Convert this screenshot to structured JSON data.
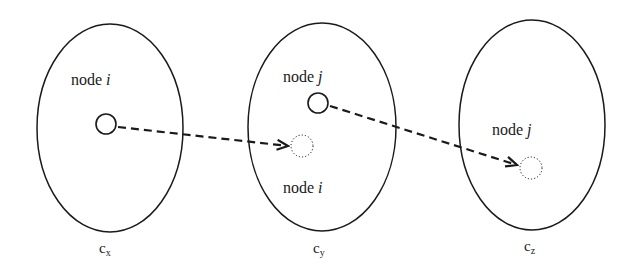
{
  "diagram": {
    "clusters": [
      {
        "id": "cx",
        "name": "c",
        "subscript": "x",
        "cx": 110,
        "cy": 128,
        "rx": 73,
        "ry": 104,
        "labels": [
          {
            "text": "node ",
            "var": "i",
            "x": 71,
            "y": 85
          }
        ]
      },
      {
        "id": "cy",
        "name": "c",
        "subscript": "y",
        "cx": 322,
        "cy": 127,
        "rx": 74,
        "ry": 104,
        "labels": [
          {
            "text": "node ",
            "var": "j",
            "x": 283,
            "y": 82
          },
          {
            "text": "node ",
            "var": "i",
            "x": 283,
            "y": 193
          }
        ]
      },
      {
        "id": "cz",
        "name": "c",
        "subscript": "z",
        "cx": 532,
        "cy": 125,
        "rx": 73,
        "ry": 105,
        "labels": [
          {
            "text": "node ",
            "var": "j",
            "x": 492,
            "y": 135
          }
        ]
      }
    ],
    "nodes": [
      {
        "id": "node-i-in-cx",
        "x": 106,
        "y": 124,
        "r": 10,
        "style": "solid"
      },
      {
        "id": "node-j-in-cy",
        "x": 318,
        "y": 103,
        "r": 10,
        "style": "solid"
      },
      {
        "id": "node-i-moved-to-cy",
        "x": 302,
        "y": 146,
        "r": 11,
        "style": "dotted"
      },
      {
        "id": "node-j-moved-to-cz",
        "x": 531,
        "y": 168,
        "r": 11,
        "style": "dotted"
      }
    ],
    "edges": [
      {
        "from": "node-i-in-cx",
        "to": "node-i-moved-to-cy",
        "style": "dashed",
        "arrow": "open"
      },
      {
        "from": "node-j-in-cy",
        "to": "node-j-moved-to-cz",
        "style": "dashed",
        "arrow": "open"
      }
    ],
    "label_texts": {
      "cx_label_i": "node ",
      "cx_var_i": "i",
      "cy_label_j": "node ",
      "cy_var_j": "j",
      "cy_label_i": "node ",
      "cy_var_i": "i",
      "cz_label_j": "node ",
      "cz_var_j": "j",
      "cluster_x_name": "c",
      "cluster_x_sub": "x",
      "cluster_y_name": "c",
      "cluster_y_sub": "y",
      "cluster_z_name": "c",
      "cluster_z_sub": "z"
    },
    "colors": {
      "stroke": "#1a1a1a",
      "background": "#ffffff"
    }
  }
}
